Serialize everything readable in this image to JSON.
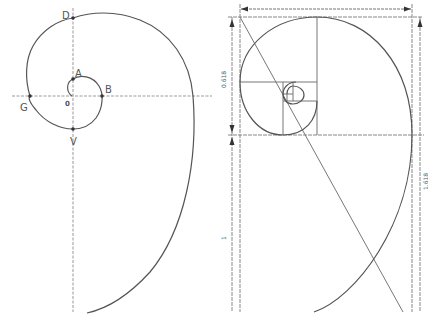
{
  "left_diagram": {
    "title": "Spiral construction with points",
    "points": {
      "D": "D",
      "A": "A",
      "B": "B",
      "G": "G",
      "V": "V",
      "origin": "0"
    }
  },
  "right_diagram": {
    "title": "Golden rectangle spiral",
    "dimensions": {
      "upper_left": "0.618",
      "lower_left": "1",
      "right": "1.618"
    }
  },
  "colors": {
    "line": "#555555",
    "axis": "#888888",
    "label": "#555555"
  }
}
